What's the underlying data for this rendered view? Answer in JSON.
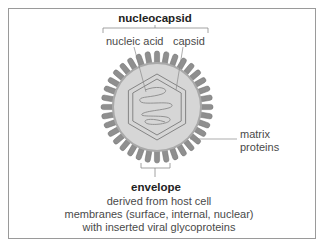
{
  "diagram": {
    "labels": {
      "nucleocapsid": "nucleocapsid",
      "nucleic_acid": "nucleic acid",
      "capsid": "capsid",
      "matrix_line1": "matrix",
      "matrix_line2": "proteins",
      "envelope": "envelope",
      "envelope_desc_line1": "derived  from host cell",
      "envelope_desc_line2": "membranes (surface, internal, nuclear)",
      "envelope_desc_line3": "with inserted viral glycoproteins"
    },
    "colors": {
      "spike_fill": "#8f8f8f",
      "disk_fill": "#d6d6d6",
      "hexagon_stroke": "#7a7a7a",
      "leader_line": "#8a8a8a",
      "frame": "#9a9a9a"
    }
  }
}
